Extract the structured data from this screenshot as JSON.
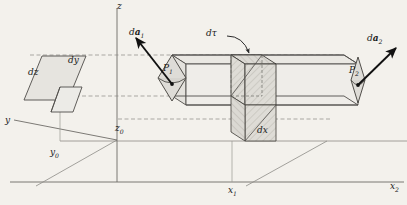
{
  "figure": {
    "background_color": "#f3f1ec",
    "line_color": "#4a4a4a",
    "axis_color": "#555555",
    "fill_light": "#e3e1dc",
    "fill_hatch": "#d8d6d0",
    "arrow_color": "#111111"
  },
  "axes": {
    "z_label": "z",
    "y_label": "y",
    "y0_label": "y",
    "y0_sub": "0",
    "z0_label": "z",
    "z0_sub": "0",
    "x1_label": "x",
    "x1_sub": "1",
    "x2_label": "x",
    "x2_sub": "2"
  },
  "elements": {
    "dz_label": "dz",
    "dy_label": "dy",
    "dx_label": "dx",
    "dtau_label": "dτ",
    "da1_prefix": "d",
    "da1_vec": "a",
    "da1_sub": "1",
    "da2_prefix": "d",
    "da2_vec": "a",
    "da2_sub": "2",
    "p1_label": "P",
    "p1_sub": "1",
    "p2_label": "P",
    "p2_sub": "2"
  }
}
